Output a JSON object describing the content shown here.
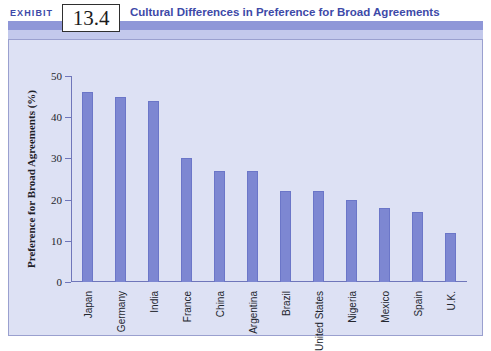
{
  "header": {
    "exhibit_label": "EXHIBIT",
    "exhibit_number": "13.4",
    "title": "Cultural Differences in Preference for Broad Agreements",
    "accent_color": "#3d49a8",
    "band_color": "#8f97d8"
  },
  "chart_data": {
    "type": "bar",
    "title": "Cultural Differences in Preference for Broad Agreements",
    "xlabel": "",
    "ylabel": "Preference for Broad Agreements (%)",
    "ylim": [
      0,
      50
    ],
    "yticks": [
      0,
      10,
      20,
      30,
      40,
      50
    ],
    "ytick_labels": [
      "0",
      "10",
      "20",
      "30",
      "40",
      "50"
    ],
    "grid": false,
    "legend": null,
    "bar_color": "#7d87d2",
    "plot_background": "#dde1f4",
    "categories": [
      "Japan",
      "Germany",
      "India",
      "France",
      "China",
      "Argentina",
      "Brazil",
      "United States",
      "Nigeria",
      "Mexico",
      "Spain",
      "U.K."
    ],
    "values": [
      46,
      45,
      44,
      30,
      27,
      27,
      22,
      22,
      20,
      18,
      17,
      12
    ]
  }
}
